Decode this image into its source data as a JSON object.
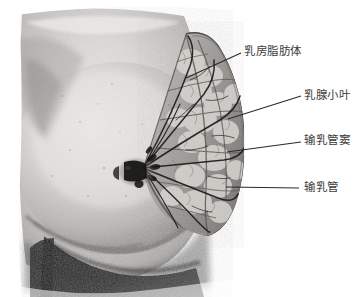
{
  "figure": {
    "background_color": "#ffffff",
    "width": 363,
    "height": 297,
    "style": "grayscale anatomical photograph"
  },
  "annotations": [
    {
      "id": "corpus-adiposum-mammae",
      "label": "乳房脂肪体",
      "label_x": 244,
      "label_y": 45,
      "leader_from_x": 186,
      "leader_from_y": 78,
      "leader_to_x": 241,
      "leader_to_y": 53,
      "color": "#2a2a2a"
    },
    {
      "id": "lobuli-glandulae-mammariae",
      "label": "乳腺小叶",
      "label_x": 304,
      "label_y": 89,
      "leader_from_x": 228,
      "leader_from_y": 119,
      "leader_to_x": 301,
      "leader_to_y": 96,
      "color": "#2a2a2a"
    },
    {
      "id": "sinus-lactiferi",
      "label": "输乳管窦",
      "label_x": 304,
      "label_y": 134,
      "leader_from_x": 227,
      "leader_from_y": 152,
      "leader_to_x": 301,
      "leader_to_y": 142,
      "color": "#2a2a2a"
    },
    {
      "id": "ductus-lactiferi",
      "label": "输乳管",
      "label_x": 304,
      "label_y": 181,
      "leader_from_x": 226,
      "leader_from_y": 187,
      "leader_to_x": 299,
      "leader_to_y": 188,
      "color": "#2a2a2a"
    }
  ],
  "illustration": {
    "nipple_x": 140,
    "nipple_y": 170,
    "gland_label": "乳腺组织",
    "skin_label": "胸壁皮肤",
    "shadow_label": "切面阴影"
  }
}
